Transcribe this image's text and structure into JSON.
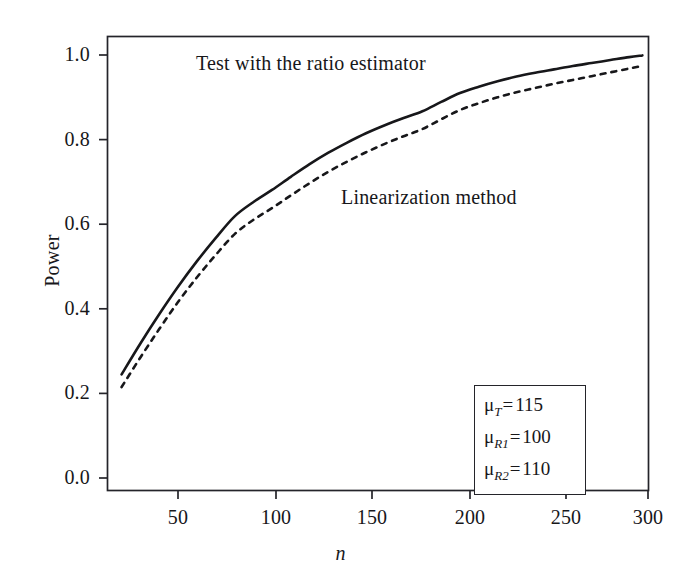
{
  "figure": {
    "background_color": "#ffffff",
    "ink_color": "#17171a"
  },
  "axes": {
    "ylabel": "Power",
    "xlabel": "n",
    "yticks": [
      "0.0",
      "0.2",
      "0.4",
      "0.6",
      "0.8",
      "1.0"
    ],
    "xticks": [
      "50",
      "100",
      "150",
      "200",
      "250",
      "300"
    ]
  },
  "annotations": {
    "solid_curve": "Test with the ratio estimator",
    "dashed_curve": "Linearization method"
  },
  "param_box": {
    "rows": [
      {
        "symbol": "μ",
        "sub": "T",
        "eq": "=",
        "value": "115"
      },
      {
        "symbol": "μ",
        "sub": "R1",
        "eq": "=",
        "value": "100"
      },
      {
        "symbol": "μ",
        "sub": "R2",
        "eq": "=",
        "value": "110"
      }
    ]
  },
  "chart_data": {
    "type": "line",
    "title": "",
    "xlabel": "n",
    "ylabel": "Power",
    "xlim": [
      14,
      300
    ],
    "ylim": [
      0.0,
      1.04
    ],
    "grid": false,
    "legend_position": "inline-annotations",
    "xticks": [
      50,
      100,
      150,
      200,
      250,
      300
    ],
    "yticks": [
      0.0,
      0.2,
      0.4,
      0.6,
      0.8,
      1.0
    ],
    "x": [
      20,
      30,
      40,
      50,
      60,
      70,
      80,
      90,
      100,
      110,
      120,
      130,
      140,
      150,
      160,
      170,
      180,
      190,
      200,
      210,
      220,
      230,
      240,
      250,
      260,
      270,
      280,
      290,
      297
    ],
    "series": [
      {
        "name": "Test with the ratio estimator",
        "style": "solid",
        "color": "#17171a",
        "values": [
          0.245,
          0.318,
          0.387,
          0.452,
          0.512,
          0.567,
          0.618,
          0.652,
          0.681,
          0.712,
          0.742,
          0.769,
          0.793,
          0.815,
          0.834,
          0.851,
          0.867,
          0.889,
          0.91,
          0.925,
          0.938,
          0.949,
          0.958,
          0.966,
          0.974,
          0.981,
          0.988,
          0.995,
          0.999
        ]
      },
      {
        "name": "Linearization method",
        "style": "dashed",
        "color": "#17171a",
        "values": [
          0.215,
          0.285,
          0.352,
          0.416,
          0.474,
          0.527,
          0.576,
          0.61,
          0.638,
          0.668,
          0.697,
          0.724,
          0.748,
          0.77,
          0.79,
          0.808,
          0.825,
          0.848,
          0.87,
          0.886,
          0.9,
          0.912,
          0.922,
          0.932,
          0.941,
          0.95,
          0.959,
          0.968,
          0.974
        ]
      }
    ]
  }
}
